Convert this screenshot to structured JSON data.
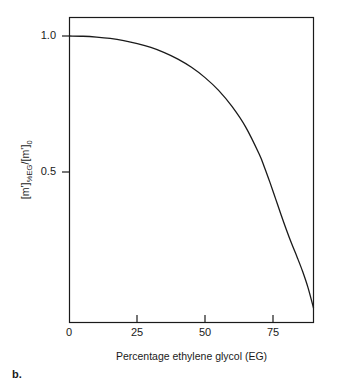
{
  "figure": {
    "panel_letter": "b."
  },
  "chart_data": {
    "type": "line",
    "title": "",
    "subtitle": "",
    "xlabel": "Percentage ethylene glycol (EG)",
    "ylabel": "[m'] %EG /[m']0",
    "ylabel_parts": {
      "lead": "[m']",
      "sub1": "%EG",
      "mid": "/[m']",
      "sub2": "0"
    },
    "xlim": [
      0,
      90
    ],
    "ylim": [
      0,
      1.06
    ],
    "xticks": [
      0,
      25,
      50,
      75
    ],
    "xtick_labels": [
      "0",
      "25",
      "50",
      "75"
    ],
    "yticks": [
      0.5,
      1.0
    ],
    "ytick_labels": [
      "0.5",
      "1.0"
    ],
    "grid": false,
    "legend": null,
    "line_color": "#1a1a1a",
    "line_width": 1.3,
    "frame": true,
    "annotations": [],
    "x": [
      0,
      5,
      10,
      15,
      20,
      25,
      30,
      35,
      40,
      45,
      50,
      55,
      60,
      65,
      70,
      72,
      74,
      76,
      78,
      80,
      82,
      84,
      86,
      88,
      90
    ],
    "y": [
      1.0,
      0.999,
      0.996,
      0.991,
      0.983,
      0.972,
      0.958,
      0.939,
      0.915,
      0.885,
      0.847,
      0.8,
      0.74,
      0.665,
      0.565,
      0.515,
      0.46,
      0.402,
      0.344,
      0.288,
      0.235,
      0.186,
      0.134,
      0.074,
      0.0
    ]
  }
}
